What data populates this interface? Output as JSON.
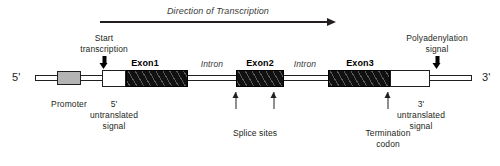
{
  "figure": {
    "title": "Direction of Transcription",
    "five_prime_label": "5'",
    "three_prime_label": "3'"
  },
  "top_arrow": {
    "label": "Direction of Transcription",
    "icon": "right-arrow-icon"
  },
  "callouts": {
    "start_transcription": {
      "line1": "Start",
      "line2": "transcription",
      "icon": "down-arrow-icon"
    },
    "polyadenylation": {
      "line1": "Polyadenylation",
      "line2": "signal",
      "icon": "down-arrow-icon"
    },
    "promoter": {
      "label": "Promoter"
    },
    "five_utr": {
      "line1": "5'",
      "line2": "untranslated",
      "line3": "signal"
    },
    "three_utr": {
      "line1": "3'",
      "line2": "untranslated",
      "line3": "signal",
      "icon": "up-arrow-icon"
    },
    "splice_sites": {
      "label": "Splice sites",
      "icon": "up-arrow-icon"
    },
    "termination_codon": {
      "line1": "Termination",
      "line2": "codon",
      "icon": "up-arrow-icon"
    }
  },
  "gene_map": {
    "segments": [
      {
        "name": "five-prime-flank",
        "kind": "line",
        "label": ""
      },
      {
        "name": "promoter",
        "kind": "promoter",
        "label": "Promoter"
      },
      {
        "name": "promoter-spacer",
        "kind": "line",
        "label": ""
      },
      {
        "name": "five-utr",
        "kind": "utr",
        "label": ""
      },
      {
        "name": "exon1",
        "kind": "exon",
        "label": "Exon1"
      },
      {
        "name": "intron1",
        "kind": "line",
        "label": "Intron"
      },
      {
        "name": "exon2",
        "kind": "exon",
        "label": "Exon2"
      },
      {
        "name": "intron2",
        "kind": "line",
        "label": "Intron"
      },
      {
        "name": "exon3",
        "kind": "exon",
        "label": "Exon3"
      },
      {
        "name": "three-utr",
        "kind": "utr",
        "label": ""
      },
      {
        "name": "three-prime-flank",
        "kind": "line",
        "label": ""
      }
    ],
    "exon_labels": [
      "Exon1",
      "Exon2",
      "Exon3"
    ],
    "intron_labels": [
      "Intron",
      "Intron"
    ]
  },
  "colors": {
    "ink": "#231f20",
    "exon_fill": "#111111",
    "promoter_fill": "#b4b4b4",
    "utr_fill": "#ffffff",
    "background": "#ffffff"
  }
}
